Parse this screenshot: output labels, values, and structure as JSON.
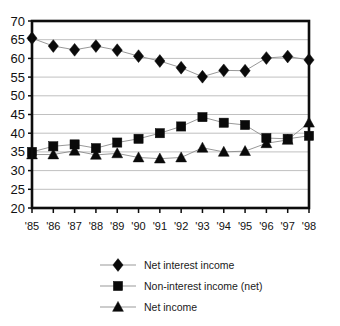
{
  "chart_data": {
    "type": "line",
    "title": "",
    "subtitle": "",
    "xlabel": "",
    "ylabel": "",
    "ylim": [
      20,
      70
    ],
    "ytick_step": 5,
    "yticks": [
      20,
      25,
      30,
      35,
      40,
      45,
      50,
      55,
      60,
      65,
      70
    ],
    "grid": true,
    "grid_axis": "y",
    "legend_position": "bottom",
    "categories": [
      "'85",
      "'86",
      "'87",
      "'88",
      "'89",
      "'90",
      "'91",
      "'92",
      "'93",
      "'94",
      "'95",
      "'96",
      "'97",
      "'98"
    ],
    "series": [
      {
        "name": "Net interest income",
        "marker": "diamond",
        "color": "#0a0a0a",
        "values": [
          65.4,
          63.3,
          62.3,
          63.3,
          62.2,
          60.6,
          59.3,
          57.5,
          55.1,
          56.8,
          56.7,
          60.1,
          60.5,
          59.6
        ]
      },
      {
        "name": "Non-interest income (net)",
        "marker": "square",
        "color": "#0a0a0a",
        "values": [
          35.0,
          36.5,
          37.0,
          36.0,
          37.5,
          38.5,
          40.0,
          41.8,
          44.3,
          42.8,
          42.2,
          38.7,
          38.5,
          39.3
        ]
      },
      {
        "name": "Net income",
        "marker": "triangle",
        "color": "#0a0a0a",
        "values": [
          34.3,
          34.3,
          35.3,
          34.2,
          34.6,
          33.5,
          33.2,
          33.5,
          36.1,
          35.0,
          35.2,
          37.3,
          38.2,
          42.8
        ]
      }
    ]
  },
  "legend": {
    "items": [
      {
        "label": "Net interest income",
        "marker": "diamond-marker-icon"
      },
      {
        "label": "Non-interest income (net)",
        "marker": "square-marker-icon"
      },
      {
        "label": "Net income",
        "marker": "triangle-marker-icon"
      }
    ]
  },
  "axes": {
    "y_tick_labels": [
      "70",
      "65",
      "60",
      "55",
      "50",
      "45",
      "40",
      "35",
      "30",
      "25",
      "20"
    ],
    "x_tick_labels": [
      "'85",
      "'86",
      "'87",
      "'88",
      "'89",
      "'90",
      "'91",
      "'92",
      "'93",
      "'94",
      "'95",
      "'96",
      "'97",
      "'98"
    ]
  }
}
